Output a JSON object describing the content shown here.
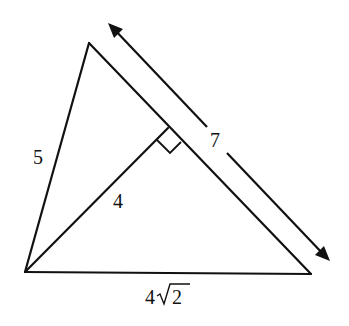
{
  "diagram": {
    "type": "geometry-triangle",
    "stroke_color": "#111111",
    "background": "#ffffff",
    "vertices": {
      "top": [
        89,
        43
      ],
      "bottom_left": [
        25,
        272
      ],
      "bottom_right": [
        311,
        274
      ]
    },
    "altitude_foot": [
      168,
      128
    ],
    "dimension_arrow": {
      "start": [
        108,
        23
      ],
      "end": [
        330,
        261
      ],
      "gap_start": [
        207,
        127
      ],
      "gap_end": [
        227,
        153
      ]
    },
    "labels": {
      "left_side": "5",
      "altitude": "4",
      "hypotenuse_dimension": "7",
      "base_coefficient": "4",
      "base_radicand": "2"
    },
    "segments": [
      {
        "name": "left-side",
        "length_label": "5"
      },
      {
        "name": "altitude",
        "length_label": "4"
      },
      {
        "name": "right-side",
        "length_label": "7"
      },
      {
        "name": "base",
        "length_label": "4√2"
      }
    ]
  }
}
